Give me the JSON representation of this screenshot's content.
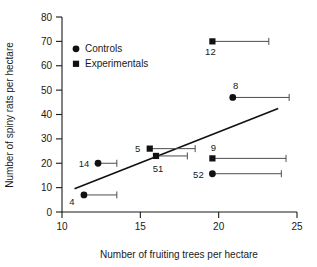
{
  "chart_data": {
    "type": "scatter",
    "title": "",
    "xlabel": "Number of fruiting trees per hectare",
    "ylabel": "Number of spiny rats per hectare",
    "xlim": [
      10,
      25
    ],
    "ylim": [
      0,
      80
    ],
    "xticks": [
      10,
      15,
      20,
      25
    ],
    "yticks": [
      0,
      10,
      20,
      30,
      40,
      50,
      60,
      70,
      80
    ],
    "xtick_labels": [
      "10",
      "15",
      "20",
      "25"
    ],
    "ytick_labels": [
      "0",
      "10",
      "20",
      "30",
      "40",
      "50",
      "60",
      "70",
      "80"
    ],
    "grid": false,
    "legend_position": "upper-left-inside",
    "series": [
      {
        "name": "Controls",
        "marker": "circle",
        "color": "#111111",
        "points": [
          {
            "label": "4",
            "x": 11.4,
            "y": 7.0,
            "xerr_high": 13.5
          },
          {
            "label": "14",
            "x": 12.3,
            "y": 20.0,
            "xerr_high": 13.5
          },
          {
            "label": "52",
            "x": 19.6,
            "y": 15.7,
            "xerr_high": 24.0
          },
          {
            "label": "8",
            "x": 20.9,
            "y": 47.0,
            "xerr_high": 24.5
          }
        ]
      },
      {
        "name": "Experimentals",
        "marker": "square",
        "color": "#111111",
        "points": [
          {
            "label": "5",
            "x": 15.6,
            "y": 26.0,
            "xerr_high": 18.5
          },
          {
            "label": "51",
            "x": 16.0,
            "y": 23.0,
            "xerr_high": 18.0
          },
          {
            "label": "9",
            "x": 19.6,
            "y": 22.0,
            "xerr_high": 24.3
          },
          {
            "label": "12",
            "x": 19.6,
            "y": 70.0,
            "xerr_high": 23.2
          }
        ]
      }
    ],
    "fit_line": {
      "x_start": 10.8,
      "y_start": 9.5,
      "x_end": 23.8,
      "y_end": 42.5
    },
    "annotations": {
      "point_labels": [
        "4",
        "14",
        "5",
        "51",
        "52",
        "9",
        "8",
        "12"
      ]
    }
  },
  "legend": {
    "entries": [
      {
        "label": "Controls",
        "marker": "circle"
      },
      {
        "label": "Experimentals",
        "marker": "square"
      }
    ]
  },
  "axes": {
    "x_title": "Number of fruiting trees per hectare",
    "y_title": "Number of spiny rats per hectare"
  }
}
